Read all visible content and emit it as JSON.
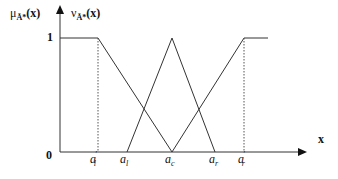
{
  "diagram": {
    "y_axis_labels": {
      "membership": "μ_Ã*(x)",
      "membership_base": "μ",
      "membership_sub": "Ã*",
      "membership_arg": "(x)",
      "non_membership": "ν_Ã*(x)",
      "non_membership_base": "ν",
      "non_membership_sub": "Ã*",
      "non_membership_arg": "(x)"
    },
    "x_axis_label": "x",
    "y_ticks": [
      "0",
      "1"
    ],
    "x_ticks": [
      {
        "base": "a",
        "sub": "l",
        "prime": "′"
      },
      {
        "base": "a",
        "sub": "l",
        "prime": ""
      },
      {
        "base": "a",
        "sub": "c",
        "prime": ""
      },
      {
        "base": "a",
        "sub": "r",
        "prime": ""
      },
      {
        "base": "a",
        "sub": "r",
        "prime": "′"
      }
    ],
    "curves": [
      {
        "name": "membership",
        "shape": "triangle",
        "points": [
          "a_l,0",
          "a_c,1",
          "a_r,0"
        ]
      },
      {
        "name": "non-membership",
        "shape": "inverted-triangle",
        "points": [
          "a'_l,1",
          "a_c,0",
          "a'_r,1"
        ]
      }
    ],
    "line_color": "#333333",
    "dotted_color": "#555555"
  }
}
